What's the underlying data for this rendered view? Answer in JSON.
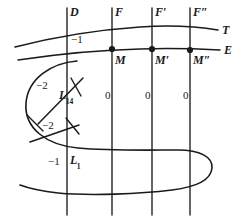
{
  "figure": {
    "stroke_color": "#1a1a1a",
    "background": "#ffffff",
    "width": 240,
    "height": 221
  },
  "vertical_lines": [
    {
      "name": "D",
      "label": "D",
      "x": 67,
      "y_top": 8,
      "y_bottom": 215
    },
    {
      "name": "F",
      "label": "F",
      "x": 112,
      "y_top": 8,
      "y_bottom": 215
    },
    {
      "name": "Fp",
      "label": "F",
      "prime": "′",
      "x": 152,
      "y_top": 8,
      "y_bottom": 215
    },
    {
      "name": "Fpp",
      "label": "F",
      "prime": "″",
      "x": 190,
      "y_top": 8,
      "y_bottom": 215
    }
  ],
  "section_labels": {
    "T": "T",
    "E": "E"
  },
  "points": [
    {
      "name": "M",
      "label": "M",
      "prime": "",
      "x": 112,
      "y": 49
    },
    {
      "name": "Mp",
      "label": "M",
      "prime": "′",
      "x": 152,
      "y": 49
    },
    {
      "name": "Mpp",
      "label": "M",
      "prime": "″",
      "x": 190,
      "y": 50
    }
  ],
  "multiplicity_labels": [
    {
      "name": "minus-one-top",
      "text": "−1",
      "x": 71,
      "y": 40
    },
    {
      "name": "minus-two-upper",
      "text": "−2",
      "x": 36,
      "y": 86
    },
    {
      "name": "minus-two-lower",
      "text": "−2",
      "x": 42,
      "y": 126
    },
    {
      "name": "minus-one-bottom",
      "text": "−1",
      "x": 48,
      "y": 162
    },
    {
      "name": "zero-first",
      "text": "0",
      "x": 105,
      "y": 96
    },
    {
      "name": "zero-second",
      "text": "0",
      "x": 145,
      "y": 96
    },
    {
      "name": "zero-third",
      "text": "0",
      "x": 183,
      "y": 96
    }
  ],
  "curve_labels": [
    {
      "name": "L14",
      "base": "L",
      "subscript": "14",
      "x": 59,
      "y": 95
    },
    {
      "name": "L1",
      "base": "L",
      "subscript": "1",
      "x": 70,
      "y": 160
    }
  ]
}
